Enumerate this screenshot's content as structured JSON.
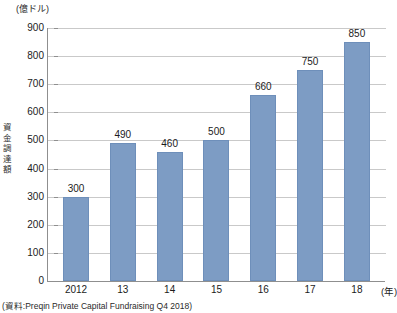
{
  "chart_data": {
    "type": "bar",
    "title": "",
    "unit_label": "(億ドル)",
    "ylabel": "資金調達額",
    "ylabel_chars": [
      "資",
      "金",
      "調",
      "達",
      "額"
    ],
    "xlabel": "(年)",
    "categories": [
      "2012",
      "13",
      "14",
      "15",
      "16",
      "17",
      "18"
    ],
    "values": [
      300,
      490,
      460,
      500,
      660,
      750,
      850
    ],
    "value_labels": [
      "300",
      "490",
      "460",
      "500",
      "660",
      "750",
      "850"
    ],
    "yticks": [
      0,
      100,
      200,
      300,
      400,
      500,
      600,
      700,
      800,
      900
    ],
    "ytick_labels": [
      "0",
      "100",
      "200",
      "300",
      "400",
      "500",
      "600",
      "700",
      "800",
      "900"
    ],
    "ylim": [
      0,
      900
    ],
    "grid": true,
    "legend": "none",
    "bar_color": "#7d9cc4",
    "grid_color": "#c9c9c9",
    "axis_color": "#8f8f8f"
  },
  "source": {
    "note": "(資料:Preqin Private Capital Fundraising Q4 2018)"
  }
}
